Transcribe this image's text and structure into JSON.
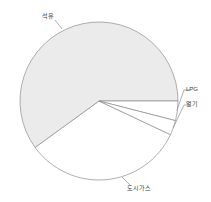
{
  "chart_data": {
    "type": "pie",
    "title": "",
    "subtitle": "",
    "xlabel": "",
    "ylabel": "",
    "legend_position": "none",
    "grid": false,
    "labels_outside": true,
    "start_angle_deg": 0,
    "direction": "clockwise",
    "categories": [
      "LPG",
      "열기",
      "도시가스",
      "석유"
    ],
    "labels": [
      "LPG",
      "열기",
      "도시가스",
      "석유"
    ],
    "values": [
      4,
      3,
      33,
      60
    ],
    "units": "%",
    "slices": [
      {
        "label": "LPG",
        "value": 4,
        "start_deg": 0,
        "end_deg": 14.4,
        "fill": "#ffffff",
        "stroke": "#8c8c8c",
        "leader": true
      },
      {
        "label": "열기",
        "value": 3,
        "start_deg": 14.4,
        "end_deg": 25.2,
        "fill": "#ffffff",
        "stroke": "#8c8c8c",
        "leader": true
      },
      {
        "label": "도시가스",
        "value": 33,
        "start_deg": 25.2,
        "end_deg": 144.0,
        "fill": "#ffffff",
        "stroke": "#8c8c8c",
        "leader": true
      },
      {
        "label": "석유",
        "value": 60,
        "start_deg": 144.0,
        "end_deg": 360.0,
        "fill": "#ebebeb",
        "stroke": "#8c8c8c",
        "leader": true
      }
    ],
    "geometry": {
      "center_x": 99,
      "center_y": 101,
      "radius": 79
    },
    "colors": {
      "fill_light_gray": "#ebebeb",
      "fill_white": "#ffffff",
      "outline": "#8c8c8c",
      "label_text": "#3a3a3a",
      "background": "#ffffff"
    }
  }
}
